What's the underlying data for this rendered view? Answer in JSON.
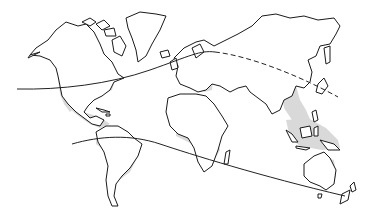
{
  "map": {
    "type": "world-outline-map",
    "background": "#ffffff",
    "outline_color": "#1a1a1a",
    "shade_color": "#d9d9d9",
    "line_color": "#222222",
    "regions_shaded": [
      "southern-north-america",
      "central-america-caribbean",
      "northern-south-america",
      "europe-shadow",
      "central-africa",
      "south-asia-indochina",
      "maritime-southeast-asia",
      "eastern-australia"
    ],
    "curves": [
      {
        "name": "northern-boundary-line",
        "solid_segment": "americas-to-europe",
        "dashed_segment": "asia",
        "path_points": [
          [
            17,
            89
          ],
          [
            120,
            80
          ],
          [
            200,
            52
          ],
          [
            260,
            60
          ],
          [
            338,
            97
          ]
        ]
      },
      {
        "name": "southern-boundary-line",
        "style": "solid",
        "path_points": [
          [
            72,
            144
          ],
          [
            140,
            140
          ],
          [
            250,
            170
          ],
          [
            345,
            195
          ]
        ]
      }
    ]
  }
}
